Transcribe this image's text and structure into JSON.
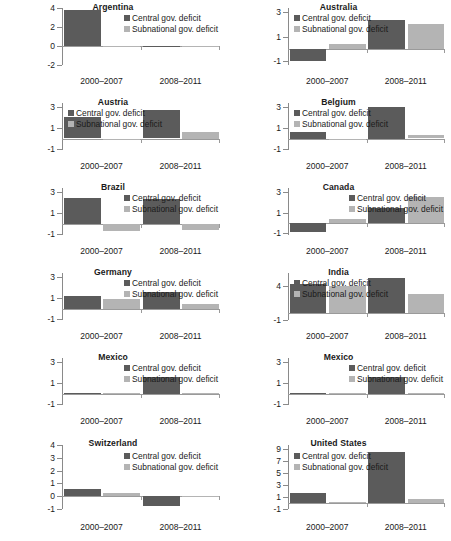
{
  "figure": {
    "legend": {
      "central_label": "Central gov. deficit",
      "subnational_label": "Subnational gov. deficit"
    },
    "xticklabels": [
      "2000–2007",
      "2008–2011"
    ],
    "colors": {
      "central": "#5b5b5b",
      "subnational": "#b4b4b4",
      "axis": "#8a8a8a"
    }
  },
  "chart_data": [
    {
      "type": "bar",
      "title": "Argentina",
      "categories": [
        "2000–2007",
        "2008–2011"
      ],
      "series": [
        {
          "name": "Central gov. deficit",
          "values": [
            3.8,
            0.0
          ]
        },
        {
          "name": "Subnational gov. deficit",
          "values": [
            -0.12,
            0.0
          ]
        }
      ],
      "ylim": [
        -2,
        4
      ],
      "yticks": [
        4,
        2,
        0,
        -2
      ],
      "yticklabels": [
        "4",
        "2",
        "0",
        "-2"
      ],
      "xlabel": "",
      "ylabel": "",
      "grid": false,
      "legend": "inside-top-right"
    },
    {
      "type": "bar",
      "title": "Australia",
      "categories": [
        "2000–2007",
        "2008–2011"
      ],
      "series": [
        {
          "name": "Central gov. deficit",
          "values": [
            -1.0,
            2.3
          ]
        },
        {
          "name": "Subnational gov. deficit",
          "values": [
            0.4,
            2.0
          ]
        }
      ],
      "ylim": [
        -1.3,
        3.3
      ],
      "yticks": [
        3,
        1,
        -1
      ],
      "yticklabels": [
        "3",
        "1",
        "-1"
      ],
      "xlabel": "",
      "ylabel": "",
      "grid": false,
      "legend": "inside-top-left"
    },
    {
      "type": "bar",
      "title": "Austria",
      "categories": [
        "2000–2007",
        "2008–2011"
      ],
      "series": [
        {
          "name": "Central gov. deficit",
          "values": [
            2.1,
            2.7
          ]
        },
        {
          "name": "Subnational gov. deficit",
          "values": [
            -0.05,
            0.6
          ]
        }
      ],
      "ylim": [
        -1.1,
        3.4
      ],
      "yticks": [
        3,
        1,
        -1
      ],
      "yticklabels": [
        "3",
        "1",
        "-1"
      ],
      "xlabel": "",
      "ylabel": "",
      "grid": false,
      "legend": "inside-top-left"
    },
    {
      "type": "bar",
      "title": "Belgium",
      "categories": [
        "2000–2007",
        "2008–2011"
      ],
      "series": [
        {
          "name": "Central gov. deficit",
          "values": [
            0.6,
            3.0
          ]
        },
        {
          "name": "Subnational gov. deficit",
          "values": [
            0.0,
            0.35
          ]
        }
      ],
      "ylim": [
        -1.1,
        3.4
      ],
      "yticks": [
        3,
        1,
        -1
      ],
      "yticklabels": [
        "3",
        "1",
        "-1"
      ],
      "xlabel": "",
      "ylabel": "",
      "grid": false,
      "legend": "inside-top-left"
    },
    {
      "type": "bar",
      "title": "Brazil",
      "categories": [
        "2000–2007",
        "2008–2011"
      ],
      "series": [
        {
          "name": "Central gov. deficit",
          "values": [
            2.4,
            2.3
          ]
        },
        {
          "name": "Subnational gov. deficit",
          "values": [
            -0.7,
            -0.6
          ]
        }
      ],
      "ylim": [
        -1.1,
        3.4
      ],
      "yticks": [
        3,
        1,
        -1
      ],
      "yticklabels": [
        "3",
        "1",
        "-1"
      ],
      "xlabel": "",
      "ylabel": "",
      "grid": false,
      "legend": "inside-top-right"
    },
    {
      "type": "bar",
      "title": "Canada",
      "categories": [
        "2000–2007",
        "2008–2011"
      ],
      "series": [
        {
          "name": "Central gov. deficit",
          "values": [
            -0.9,
            1.4
          ]
        },
        {
          "name": "Subnational gov. deficit",
          "values": [
            0.4,
            2.5
          ]
        }
      ],
      "ylim": [
        -1.2,
        3.4
      ],
      "yticks": [
        3,
        1,
        -1
      ],
      "yticklabels": [
        "3",
        "1",
        "-1"
      ],
      "xlabel": "",
      "ylabel": "",
      "grid": false,
      "legend": "inside-top-right"
    },
    {
      "type": "bar",
      "title": "Germany",
      "categories": [
        "2000–2007",
        "2008–2011"
      ],
      "series": [
        {
          "name": "Central gov. deficit",
          "values": [
            1.2,
            1.6
          ]
        },
        {
          "name": "Subnational gov. deficit",
          "values": [
            0.9,
            0.4
          ]
        }
      ],
      "ylim": [
        -1.1,
        3.4
      ],
      "yticks": [
        3,
        1,
        -1
      ],
      "yticklabels": [
        "3",
        "1",
        "-1"
      ],
      "xlabel": "",
      "ylabel": "",
      "grid": false,
      "legend": "inside-top-right"
    },
    {
      "type": "bar",
      "title": "India",
      "categories": [
        "2000–2007",
        "2008–2011"
      ],
      "series": [
        {
          "name": "Central gov. deficit",
          "values": [
            4.3,
            5.3
          ]
        },
        {
          "name": "Subnational gov. deficit",
          "values": [
            4.1,
            2.9
          ]
        }
      ],
      "ylim": [
        -1,
        6
      ],
      "yticks": [
        4,
        -1
      ],
      "yticklabels": [
        "4",
        "-1"
      ],
      "xlabel": "",
      "ylabel": "",
      "grid": false,
      "legend": "inside-top-left"
    },
    {
      "type": "bar",
      "title": "Mexico",
      "categories": [
        "2000–2007",
        "2008–2011"
      ],
      "series": [
        {
          "name": "Central gov. deficit",
          "values": [
            0.08,
            1.6
          ]
        },
        {
          "name": "Subnational gov. deficit",
          "values": [
            0.02,
            0.03
          ]
        }
      ],
      "ylim": [
        -1.1,
        3.4
      ],
      "yticks": [
        3,
        1,
        -1
      ],
      "yticklabels": [
        "3",
        "1",
        "-1"
      ],
      "xlabel": "",
      "ylabel": "",
      "grid": false,
      "legend": "inside-top-right"
    },
    {
      "type": "bar",
      "title": "Mexico",
      "categories": [
        "2000–2007",
        "2008–2011"
      ],
      "series": [
        {
          "name": "Central gov. deficit",
          "values": [
            0.08,
            1.6
          ]
        },
        {
          "name": "Subnational gov. deficit",
          "values": [
            0.02,
            0.03
          ]
        }
      ],
      "ylim": [
        -1.1,
        3.4
      ],
      "yticks": [
        3,
        1,
        -1
      ],
      "yticklabels": [
        "3",
        "1",
        "-1"
      ],
      "xlabel": "",
      "ylabel": "",
      "grid": false,
      "legend": "inside-top-right"
    },
    {
      "type": "bar",
      "title": "Switzerland",
      "categories": [
        "2000–2007",
        "2008–2011"
      ],
      "series": [
        {
          "name": "Central gov. deficit",
          "values": [
            0.55,
            -0.75
          ]
        },
        {
          "name": "Subnational gov. deficit",
          "values": [
            0.25,
            -0.1
          ]
        }
      ],
      "ylim": [
        -1,
        4
      ],
      "yticks": [
        4,
        3,
        2,
        1,
        0,
        -1
      ],
      "yticklabels": [
        "4",
        "3",
        "2",
        "1",
        "0",
        "-1"
      ],
      "xlabel": "",
      "ylabel": "",
      "grid": false,
      "legend": "inside-top-right"
    },
    {
      "type": "bar",
      "title": "United States",
      "categories": [
        "2000–2007",
        "2008–2011"
      ],
      "series": [
        {
          "name": "Central gov. deficit",
          "values": [
            1.6,
            8.5
          ]
        },
        {
          "name": "Subnational gov. deficit",
          "values": [
            0.2,
            0.7
          ]
        }
      ],
      "ylim": [
        -1,
        9.6
      ],
      "yticks": [
        9,
        7,
        5,
        3,
        1,
        -1
      ],
      "yticklabels": [
        "9",
        "7",
        "5",
        "3",
        "1",
        "-1"
      ],
      "xlabel": "",
      "ylabel": "",
      "grid": false,
      "legend": "inside-top-left"
    }
  ]
}
